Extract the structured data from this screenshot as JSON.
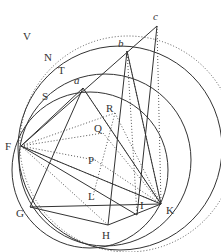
{
  "diagram": {
    "width": 221,
    "height": 252,
    "colors": {
      "stroke": "#333333",
      "dotted": "#555555",
      "background": "#ffffff"
    },
    "points": {
      "a": {
        "x": 83,
        "y": 88,
        "label": "a",
        "lx": 74,
        "ly": 84,
        "italic": true
      },
      "b": {
        "x": 127,
        "y": 51,
        "label": "b",
        "lx": 118,
        "ly": 47,
        "italic": true
      },
      "c": {
        "x": 157,
        "y": 26,
        "label": "c",
        "lx": 153,
        "ly": 20,
        "italic": true
      },
      "F": {
        "x": 21,
        "y": 146,
        "label": "F",
        "lx": 5,
        "ly": 150,
        "italic": false
      },
      "G": {
        "x": 30,
        "y": 207,
        "label": "G",
        "lx": 16,
        "ly": 217,
        "italic": false
      },
      "H": {
        "x": 108,
        "y": 225,
        "label": "H",
        "lx": 102,
        "ly": 239,
        "italic": false
      },
      "I": {
        "x": 137,
        "y": 215,
        "label": "I",
        "lx": 140,
        "ly": 209,
        "italic": false
      },
      "K": {
        "x": 161,
        "y": 204,
        "label": "K",
        "lx": 166,
        "ly": 214,
        "italic": false
      },
      "R": {
        "x": 115,
        "y": 113,
        "label": "R",
        "lx": 106,
        "ly": 112,
        "italic": false
      },
      "Q": {
        "x": 103,
        "y": 133,
        "label": "Q",
        "lx": 94,
        "ly": 132,
        "italic": false
      },
      "P": {
        "x": 95,
        "y": 160,
        "label": "P",
        "lx": 88,
        "ly": 164,
        "italic": false
      },
      "L": {
        "x": 93,
        "y": 196,
        "label": "L",
        "lx": 88,
        "ly": 200,
        "italic": false
      }
    },
    "arc_labels": [
      {
        "text": "V",
        "x": 23,
        "y": 40
      },
      {
        "text": "N",
        "x": 44,
        "y": 61
      },
      {
        "text": "T",
        "x": 58,
        "y": 74
      },
      {
        "text": "S",
        "x": 42,
        "y": 100
      }
    ],
    "circles_solid": [
      {
        "name": "circle-aFGHIK",
        "cx": 90,
        "cy": 170,
        "r": 78
      },
      {
        "name": "circle-bF",
        "cx": 105,
        "cy": 160,
        "r": 86
      },
      {
        "name": "circle-cF",
        "cx": 120,
        "cy": 148,
        "r": 102
      }
    ],
    "circles_dotted": [
      {
        "name": "circle-dotted-outer",
        "cx": 128,
        "cy": 144,
        "r": 108
      }
    ],
    "lines_solid": [
      [
        "F",
        "c"
      ],
      [
        "F",
        "a"
      ],
      [
        "a",
        "G"
      ],
      [
        "G",
        "H"
      ],
      [
        "H",
        "K"
      ],
      [
        "a",
        "K"
      ],
      [
        "b",
        "H"
      ],
      [
        "c",
        "I"
      ],
      [
        "F",
        "I"
      ],
      [
        "F",
        "K"
      ],
      [
        "G",
        "K"
      ],
      [
        "b",
        "K"
      ]
    ],
    "lines_dotted": [
      [
        "a",
        "K"
      ],
      [
        "b",
        "K"
      ],
      [
        "c",
        "K"
      ],
      [
        "F",
        "R"
      ],
      [
        "F",
        "Q"
      ],
      [
        "F",
        "P"
      ],
      [
        "R",
        "L"
      ],
      [
        "F",
        "H"
      ],
      [
        "F",
        "K"
      ],
      [
        "Q",
        "K"
      ],
      [
        "R",
        "K"
      ],
      [
        "P",
        "K"
      ],
      [
        "b",
        "I"
      ]
    ]
  }
}
